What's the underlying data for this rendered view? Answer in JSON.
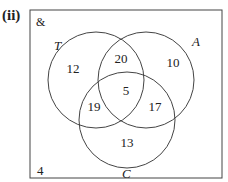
{
  "part_label": "(ii)",
  "universal_symbol": "&",
  "sets": {
    "T": {
      "label": "T",
      "only": "12"
    },
    "A": {
      "label": "A",
      "only": "10"
    },
    "C": {
      "label": "C",
      "only": "13"
    }
  },
  "regions": {
    "T_and_A_only": "20",
    "T_and_C_only": "19",
    "A_and_C_only": "17",
    "all_three": "5",
    "outside": "4"
  },
  "colors": {
    "line": "#444444",
    "text": "#222222",
    "background": "#ffffff"
  }
}
